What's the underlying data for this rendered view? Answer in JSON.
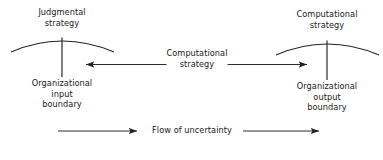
{
  "diagram": {
    "stroke_color": "#222222",
    "text_color": "#1a1a1a",
    "background_color": "#ffffff",
    "labels": {
      "left_top": {
        "line1": "Judgmental",
        "line2": "strategy"
      },
      "right_top": {
        "line1": "Computational",
        "line2": "strategy"
      },
      "center": {
        "line1": "Computational",
        "line2": "strategy"
      },
      "left_bottom": {
        "line1": "Organizational",
        "line2": "input",
        "line3": "boundary"
      },
      "right_bottom": {
        "line1": "Organizational",
        "line2": "output",
        "line3": "boundary"
      },
      "flow": {
        "line1": "Flow of uncertainty"
      }
    }
  }
}
